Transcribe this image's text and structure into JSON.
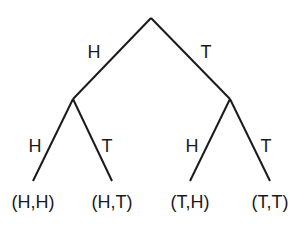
{
  "diagram": {
    "type": "probability-tree",
    "root": {
      "x": 151,
      "y": 18
    },
    "level1": [
      {
        "branch_label": "H",
        "node": {
          "x": 73,
          "y": 99
        },
        "label_pos": {
          "x": 94,
          "y": 58
        }
      },
      {
        "branch_label": "T",
        "node": {
          "x": 230,
          "y": 99
        },
        "label_pos": {
          "x": 206,
          "y": 58
        }
      }
    ],
    "level2": [
      {
        "parent": 0,
        "branch_label": "H",
        "end": {
          "x": 33,
          "y": 181
        },
        "label_pos": {
          "x": 35,
          "y": 152
        },
        "outcome": "(H,H)",
        "outcome_pos": {
          "x": 33,
          "y": 208
        }
      },
      {
        "parent": 0,
        "branch_label": "T",
        "end": {
          "x": 112,
          "y": 181
        },
        "label_pos": {
          "x": 107,
          "y": 152
        },
        "outcome": "(H,T)",
        "outcome_pos": {
          "x": 112,
          "y": 208
        }
      },
      {
        "parent": 1,
        "branch_label": "H",
        "end": {
          "x": 190,
          "y": 181
        },
        "label_pos": {
          "x": 192,
          "y": 152
        },
        "outcome": "(T,H)",
        "outcome_pos": {
          "x": 190,
          "y": 208
        }
      },
      {
        "parent": 1,
        "branch_label": "T",
        "end": {
          "x": 270,
          "y": 181
        },
        "label_pos": {
          "x": 266,
          "y": 152
        },
        "outcome": "(T,T)",
        "outcome_pos": {
          "x": 270,
          "y": 208
        }
      }
    ]
  }
}
